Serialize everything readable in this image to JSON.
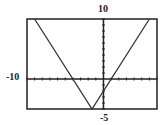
{
  "chart_data": {
    "type": "line",
    "title": "",
    "function": "y = 2|x + 1.5| - 5",
    "x": [
      -10,
      -9,
      -1.5,
      6,
      7
    ],
    "y": [
      null,
      10,
      -5,
      10,
      null
    ],
    "xlim": [
      -10,
      7
    ],
    "ylim": [
      -5,
      10
    ],
    "x_tick_step": 1,
    "y_tick_step": 1,
    "labels": {
      "xmin": "-10",
      "ymax": "10",
      "ymin": "-5"
    },
    "grid": false,
    "xlabel": "",
    "ylabel": ""
  },
  "colors": {
    "line": "#333333",
    "axis": "#222222",
    "frame": "#222222"
  }
}
